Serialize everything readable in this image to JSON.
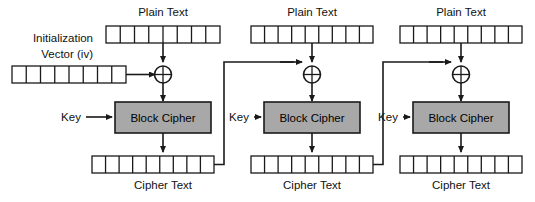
{
  "diagram": {
    "type": "block-diagram",
    "width": 535,
    "height": 202,
    "colors": {
      "background": "#ffffff",
      "line": "#1a1a1a",
      "cipher_box_fill": "#a8a8a8",
      "cell_fill": "#ffffff",
      "text": "#111111"
    }
  },
  "labels": {
    "initialization_vector_line1": "Initialization",
    "initialization_vector_line2": "Vector (iv)",
    "plain_text": "Plain Text",
    "cipher_text": "Cipher Text",
    "key": "Key",
    "block_cipher": "Block Cipher",
    "xor": "xor-operator"
  },
  "blocks": [
    {
      "index": 1,
      "plain_text_label": "Plain Text",
      "plain_text_cells": 8,
      "cipher_text_label": "Cipher Text",
      "cipher_text_cells": 9,
      "key_label": "Key",
      "block_cipher_label": "Block Cipher",
      "has_iv_input": true,
      "feeds_next": true
    },
    {
      "index": 2,
      "plain_text_label": "Plain Text",
      "plain_text_cells": 9,
      "cipher_text_label": "Cipher Text",
      "cipher_text_cells": 9,
      "key_label": "Key",
      "block_cipher_label": "Block Cipher",
      "has_iv_input": false,
      "feeds_next": true
    },
    {
      "index": 3,
      "plain_text_label": "Plain Text",
      "plain_text_cells": 9,
      "cipher_text_label": "Cipher Text",
      "cipher_text_cells": 9,
      "key_label": "Key",
      "block_cipher_label": "Block Cipher",
      "has_iv_input": false,
      "feeds_next": false
    }
  ],
  "iv": {
    "label_line1": "Initialization",
    "label_line2": "Vector (iv)",
    "cells": 8
  }
}
